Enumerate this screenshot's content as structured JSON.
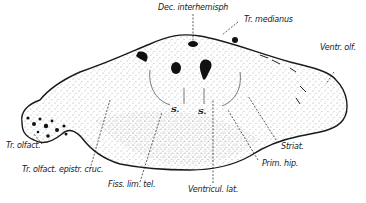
{
  "figure": {
    "labels": {
      "dec_interhemisph": "Dec. interhemisph",
      "tr_medianus": "Tr. medianus",
      "ventr_olf": "Ventr. olf.",
      "tr_olfact": "Tr. olfact.",
      "tr_olfact_epistr_cruc": "Tr. olfact. epistr. cruc.",
      "fiss_lim_tel": "Fiss. lim. tel.",
      "ventricul_lat": "Ventricul. lat.",
      "prim_hip": "Prim. hip.",
      "striat": "Striat.",
      "s_left": "S.",
      "s_right": "S."
    },
    "colors": {
      "ink": "#1a1a1a",
      "paper": "#ffffff",
      "stipple": "#555555"
    }
  }
}
